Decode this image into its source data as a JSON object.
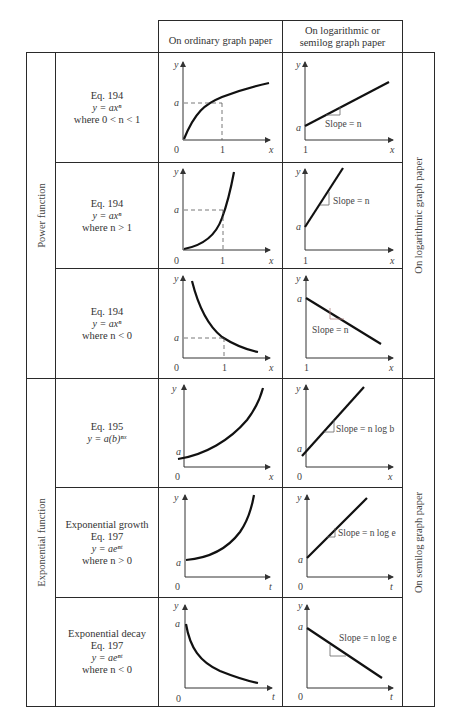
{
  "header": {
    "col_ordinary": "On ordinary graph paper",
    "col_log_line1": "On logarithmic or",
    "col_log_line2": "semilog graph paper"
  },
  "groups": {
    "power": "Power function",
    "exponential": "Exponential function",
    "log_paper": "On logarithmic graph paper",
    "semilog_paper": "On semilog graph paper"
  },
  "rows": [
    {
      "title": "",
      "eq": "Eq. 194",
      "formula": "y = axⁿ",
      "cond": "where 0 < n < 1",
      "left": {
        "y": "y",
        "x": "x",
        "origin": "0",
        "one": "1",
        "a": "a"
      },
      "right": {
        "y": "y",
        "x": "x",
        "origin": "1",
        "a": "a",
        "slope": "Slope = n"
      }
    },
    {
      "title": "",
      "eq": "Eq. 194",
      "formula": "y = axⁿ",
      "cond": "where n > 1",
      "left": {
        "y": "y",
        "x": "x",
        "origin": "0",
        "one": "1",
        "a": "a"
      },
      "right": {
        "y": "y",
        "x": "x",
        "origin": "1",
        "a": "a",
        "slope": "Slope = n"
      }
    },
    {
      "title": "",
      "eq": "Eq. 194",
      "formula": "y = axⁿ",
      "cond": "where n < 0",
      "left": {
        "y": "y",
        "x": "x",
        "origin": "0",
        "one": "1",
        "a": "a"
      },
      "right": {
        "y": "y",
        "x": "x",
        "origin": "1",
        "a": "a",
        "slope": "Slope = n"
      }
    },
    {
      "title": "",
      "eq": "Eq. 195",
      "formula": "y = a(b)ⁿˣ",
      "cond": "",
      "left": {
        "y": "y",
        "x": "x",
        "origin": "0",
        "a": "a"
      },
      "right": {
        "y": "y",
        "x": "x",
        "origin": "0",
        "a": "a",
        "slope": "Slope = n log b"
      }
    },
    {
      "title": "Exponential growth",
      "eq": "Eq. 197",
      "formula": "y = aeⁿᵗ",
      "cond": "where n > 0",
      "left": {
        "y": "y",
        "x": "t",
        "origin": "0",
        "a": "a"
      },
      "right": {
        "y": "y",
        "x": "t",
        "origin": "0",
        "a": "a",
        "slope": "Slope = n log e"
      }
    },
    {
      "title": "Exponential decay",
      "eq": "Eq. 197",
      "formula": "y = aeⁿᵗ",
      "cond": "where n < 0",
      "left": {
        "y": "y",
        "x": "t",
        "origin": "0",
        "a": "a"
      },
      "right": {
        "y": "y",
        "x": "t",
        "origin": "0",
        "a": "a",
        "slope": "Slope = n log e"
      }
    }
  ]
}
